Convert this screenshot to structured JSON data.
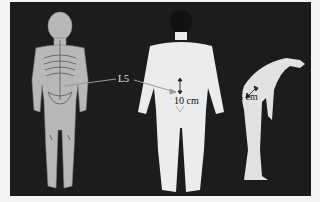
{
  "figure": {
    "background_color": "#1c1c1c",
    "figures": [
      {
        "name": "skeleton-front-view",
        "description": "Front view of human body with skeleton overlay"
      },
      {
        "name": "back-view",
        "description": "Rear view of standing human figure"
      },
      {
        "name": "side-flexion-view",
        "description": "Side view of figure bending forward"
      }
    ],
    "labels": {
      "l5": "L5",
      "standing_measure": "10 cm",
      "flexion_measure": "5 cm"
    }
  }
}
